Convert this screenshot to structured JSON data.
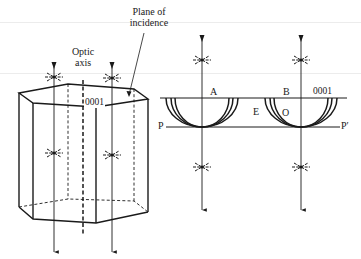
{
  "figure": {
    "colors": {
      "ink": "#1a1a1a",
      "background": "#ffffff",
      "scan_line": "#ececec"
    }
  },
  "left_panel": {
    "labels": {
      "plane_of_incidence_line1": "Plane of",
      "plane_of_incidence_line2": "incidence",
      "optic_axis_line1": "Optic",
      "optic_axis_line2": "axis",
      "face": "0001"
    },
    "elements": {
      "crystal": "hexagonal-prism",
      "optic_axis": "dashed-vertical-line",
      "rays": 2,
      "polarization_symbol": "star-icon"
    }
  },
  "right_panel": {
    "labels": {
      "point_a": "A",
      "point_b": "B",
      "face": "0001",
      "extraordinary": "E",
      "ordinary": "O",
      "plane_p": "P",
      "plane_p_prime": "P′"
    },
    "elements": {
      "wavefronts": "semicircular-huygens-wavelets",
      "rays": 2,
      "polarization_symbol": "star-icon"
    }
  }
}
